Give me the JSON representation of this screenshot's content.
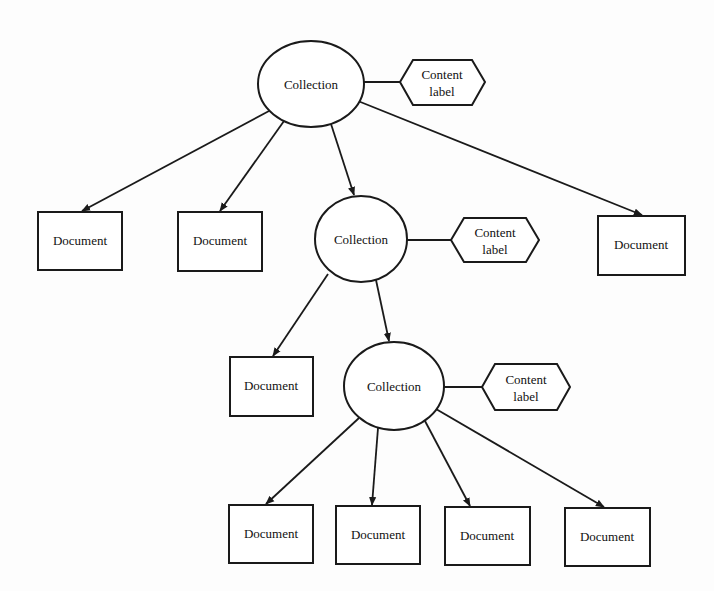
{
  "diagram": {
    "type": "hierarchy",
    "collections": [
      {
        "id": "c1",
        "label": "Collection",
        "content_label": "Content label"
      },
      {
        "id": "c2",
        "label": "Collection",
        "content_label": "Content label"
      },
      {
        "id": "c3",
        "label": "Collection",
        "content_label": "Content label"
      }
    ],
    "documents": [
      {
        "id": "d1",
        "label": "Document",
        "parent": "c1"
      },
      {
        "id": "d2",
        "label": "Document",
        "parent": "c1"
      },
      {
        "id": "d3",
        "label": "Document",
        "parent": "c1"
      },
      {
        "id": "d4",
        "label": "Document",
        "parent": "c2"
      },
      {
        "id": "d5",
        "label": "Document",
        "parent": "c3"
      },
      {
        "id": "d6",
        "label": "Document",
        "parent": "c3"
      },
      {
        "id": "d7",
        "label": "Document",
        "parent": "c3"
      },
      {
        "id": "d8",
        "label": "Document",
        "parent": "c3"
      }
    ],
    "content_label_line1": "Content",
    "content_label_line2": "label",
    "edges": [
      [
        "c1",
        "d1"
      ],
      [
        "c1",
        "d2"
      ],
      [
        "c1",
        "c2"
      ],
      [
        "c1",
        "d3"
      ],
      [
        "c2",
        "d4"
      ],
      [
        "c2",
        "c3"
      ],
      [
        "c3",
        "d5"
      ],
      [
        "c3",
        "d6"
      ],
      [
        "c3",
        "d7"
      ],
      [
        "c3",
        "d8"
      ]
    ]
  }
}
